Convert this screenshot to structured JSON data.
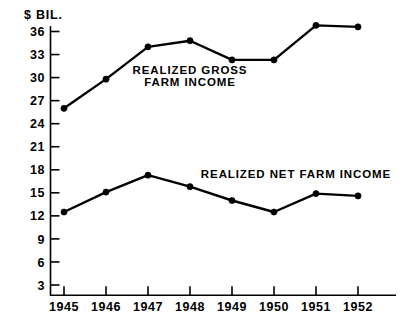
{
  "chart_data": {
    "type": "line",
    "title": "",
    "subtitle": "",
    "unit_label": "$ BIL.",
    "xlabel": "",
    "ylabel": "$ BIL.",
    "x": [
      "1945",
      "1946",
      "1947",
      "1948",
      "1949",
      "1950",
      "1951",
      "1952"
    ],
    "categories": [
      "1945",
      "1946",
      "1947",
      "1948",
      "1949",
      "1950",
      "1951",
      "1952"
    ],
    "ylim": [
      0,
      37.5
    ],
    "xticklabels": [
      "1945",
      "1946",
      "1947",
      "1948",
      "1949",
      "1950",
      "1951",
      "1952"
    ],
    "yticks": [
      3,
      6,
      9,
      12,
      15,
      18,
      21,
      24,
      27,
      30,
      33,
      36
    ],
    "yticklabels": [
      "3",
      "6",
      "9",
      "12",
      "15",
      "18",
      "21",
      "24",
      "27",
      "30",
      "33",
      "36"
    ],
    "grid": false,
    "legend_position": "inline-annotation",
    "series": [
      {
        "name": "REALIZED GROSS FARM INCOME",
        "values": [
          26.0,
          29.8,
          34.0,
          34.8,
          32.3,
          32.3,
          36.8,
          36.6
        ],
        "marker": "filled-circle",
        "color": "#000000"
      },
      {
        "name": "REALIZED NET FARM INCOME",
        "values": [
          12.5,
          15.1,
          17.3,
          15.8,
          14.0,
          12.5,
          14.9,
          14.6
        ],
        "marker": "filled-circle",
        "color": "#000000"
      }
    ],
    "annotations": [
      {
        "id": "gross-label-line1",
        "text": "REALIZED  GROSS",
        "x": 1947.0,
        "y": 30.2
      },
      {
        "id": "gross-label-line2",
        "text": "FARM   INCOME",
        "x": 1947.0,
        "y": 28.3
      },
      {
        "id": "net-label",
        "text": "REALIZED  NET FARM INCOME",
        "x": 1950.3,
        "y": 16.4
      }
    ]
  },
  "axes": {
    "unit_caption": "$ BIL."
  }
}
